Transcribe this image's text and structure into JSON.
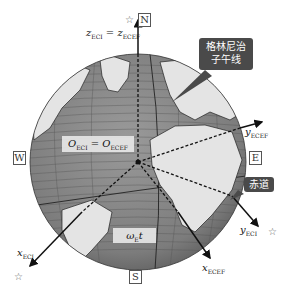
{
  "directions": {
    "north": "N",
    "south": "S",
    "east": "E",
    "west": "W"
  },
  "axes": {
    "z_label": {
      "var": "z",
      "sub1": "ECI",
      "eq": " = ",
      "var2": "z",
      "sub2": "ECEF"
    },
    "y_ecef": {
      "var": "y",
      "sub": "ECEF"
    },
    "y_eci": {
      "var": "y",
      "sub": "ECI"
    },
    "x_eci": {
      "var": "x",
      "sub": "ECI"
    },
    "x_ecef": {
      "var": "x",
      "sub": "ECEF"
    }
  },
  "origin_label": {
    "var": "O",
    "sub1": "ECI",
    "eq": " = ",
    "var2": "O",
    "sub2": "ECEF"
  },
  "angle_label": {
    "omega": "ω",
    "sub": "E",
    "t": "t"
  },
  "callouts": {
    "greenwich": {
      "line1": "格林尼治",
      "line2": "子午线"
    },
    "equator": "赤道"
  },
  "star_symbol": "☆",
  "colors": {
    "ocean": "#8a8a8a",
    "land": "#e4e4e4",
    "callout_bg": "#4a4a4a",
    "axis": "#111111"
  }
}
